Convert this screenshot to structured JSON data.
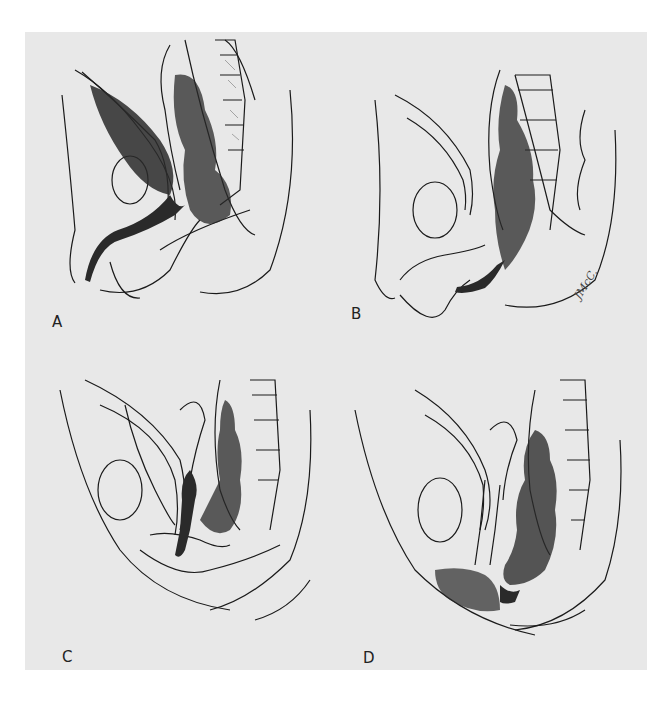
{
  "figure": {
    "background": "#e8e8e8",
    "ink": "#1a1a1a",
    "panels": [
      {
        "id": "A",
        "label": "A",
        "description": "Male sagittal pelvis, fistula connecting rectum to urethra/bladder"
      },
      {
        "id": "B",
        "label": "B",
        "description": "Male sagittal pelvis, rectum ending low near perineum"
      },
      {
        "id": "C",
        "label": "C",
        "description": "Female sagittal pelvis, rectovaginal communication"
      },
      {
        "id": "D",
        "label": "D",
        "description": "Female sagittal pelvis, rectum opening to perineal region"
      }
    ],
    "signature": "JMcC."
  }
}
